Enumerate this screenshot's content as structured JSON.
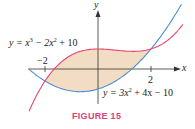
{
  "figure": {
    "caption": "FIGURE 15",
    "axis_x_label": "x",
    "axis_y_label": "y",
    "tick_neg": "−2",
    "tick_pos": "2",
    "curve1_label": {
      "pre": "y = x",
      "exp1": "3",
      "mid": " − 2x",
      "exp2": "2",
      "post": " + 10"
    },
    "curve2_label": {
      "pre": "y = 3x",
      "exp1": "2",
      "post": " + 4x − 10"
    }
  },
  "colors": {
    "cubic": "#e8456e",
    "quadratic": "#4a8fd0",
    "fill": "#f2dcc4",
    "axis": "#333333",
    "caption": "#e0407a"
  },
  "chart_data": {
    "type": "line",
    "title": "FIGURE 15",
    "xlabel": "x",
    "ylabel": "y",
    "series": [
      {
        "name": "y = x^3 - 2x^2 + 10",
        "formula": "x^3-2x^2+10",
        "color": "#e8456e"
      },
      {
        "name": "y = 3x^2 + 4x - 10",
        "formula": "3x^2+4x-10",
        "color": "#4a8fd0"
      }
    ],
    "shaded_region": {
      "between": [
        "y = x^3 - 2x^2 + 10",
        "y = 3x^2 + 4x - 10"
      ],
      "x_range": [
        -2,
        2
      ]
    },
    "x_ticks": [
      -2,
      2
    ],
    "xlim": [
      -3.3,
      3.6
    ],
    "ylim": [
      -17,
      30
    ],
    "grid": false
  }
}
